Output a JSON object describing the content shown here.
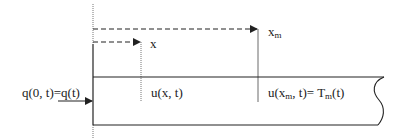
{
  "diagram": {
    "type": "heat-conduction-rod",
    "labels": {
      "x": "x",
      "x_m_base": "x",
      "x_m_sub": "m",
      "flux": "q(0, t)=q(t)",
      "u_x": "u(x, t)",
      "u_xm_prefix": "u(x",
      "u_xm_sub1": "m",
      "u_xm_mid": ", t)= T",
      "u_xm_sub2": "m",
      "u_xm_suffix": "(t)"
    },
    "colors": {
      "line": "#222222",
      "background": "#ffffff"
    }
  }
}
